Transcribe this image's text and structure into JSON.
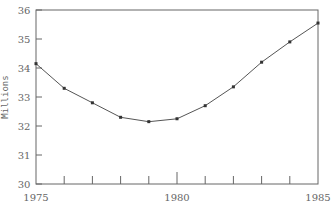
{
  "chart_data": {
    "type": "line",
    "title": "",
    "xlabel": "",
    "ylabel": "Millions",
    "x": [
      1975,
      1976,
      1977,
      1978,
      1979,
      1980,
      1981,
      1982,
      1983,
      1984,
      1985
    ],
    "series": [
      {
        "name": "",
        "values": [
          34.15,
          33.3,
          32.8,
          32.3,
          32.15,
          32.25,
          32.7,
          33.35,
          34.2,
          34.9,
          35.55
        ]
      }
    ],
    "xlim": [
      1975,
      1985
    ],
    "ylim": [
      30,
      36
    ],
    "x_tick_labels": [
      "1975",
      "1980",
      "1985"
    ],
    "x_minor_ticks": [
      1976,
      1977,
      1978,
      1979,
      1980,
      1981,
      1982,
      1983,
      1984
    ],
    "y_ticks": [
      30,
      31,
      32,
      33,
      34,
      35,
      36
    ],
    "y_tick_labels": [
      "30",
      "31",
      "32",
      "33",
      "34",
      "35",
      "36"
    ],
    "grid": false,
    "legend": null,
    "markers": true,
    "line_color": "#555555"
  }
}
